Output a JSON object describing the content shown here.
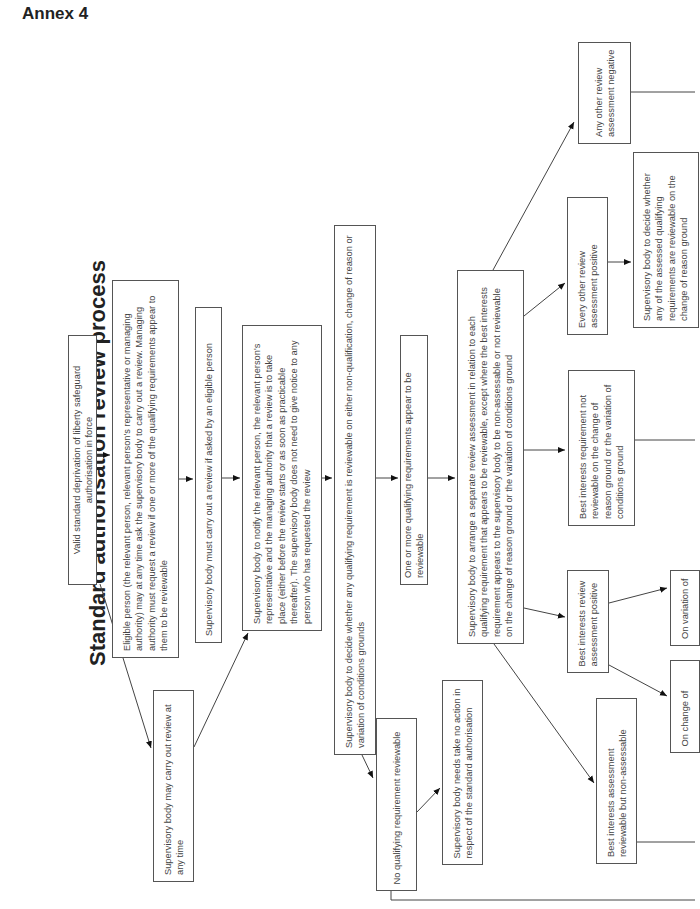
{
  "header": {
    "annex_label": "Annex 4"
  },
  "diagram": {
    "title": "Standard authorisation review process",
    "nodes": {
      "valid_dols": "Valid standard deprivation of liberty safeguard authorisation in force",
      "eligible_person": "Eligible person (the relevant person, relevant person's representative or managing authority) may at any time ask the supervisory body to carry out a review. Managing authority must request a review if one or more of the qualifying requirements appear to them to be reviewable",
      "must_carry_out": "Supervisory body must carry out a review if asked by an eligible person",
      "may_carry_out": "Supervisory body may carry out review at any time",
      "notify": "Supervisory body to notify the relevant person, the relevant person's representative and the managing authority that a review is to take place (either before the review starts or as soon as practicable thereafter). The supervisory body does not need to give notice to any person who has requested the review",
      "decide_reviewable": "Supervisory body to decide whether any qualifying requirement is reviewable on either non-qualification, change of reason or variation of conditions grounds",
      "one_or_more": "One or more qualifying requirements appear to be reviewable",
      "no_qualifying": "No qualifying requirement reviewable",
      "no_action": "Supervisory body needs take no action in respect of the standard authorisation",
      "arrange_assessment": "Supervisory body to arrange a separate review assessment in relation to each qualifying requirement that appears to be reviewable, except where the best interests requirement appears to the supervisory body to be non-assessable or not reviewable on the change of reason ground or the variation of conditions ground",
      "any_other_negative": "Any other review assessment negative",
      "every_other_positive": "Every other review assessment positive",
      "decide_change_of_reason": "Supervisory body to decide whether any of the assessed qualifying requirements are reviewable on the change of reason ground",
      "bi_not_reviewable": "Best interests requirement not reviewable on the change of reason ground or the variation of conditions ground",
      "bi_positive": "Best interests review assessment positive",
      "bi_non_assessable": "Best interests assessment reviewable but non-assessable",
      "on_variation_of": "On variation of",
      "on_change_of": "On change of"
    }
  }
}
